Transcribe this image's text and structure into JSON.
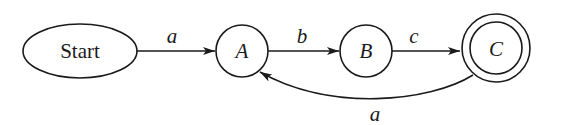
{
  "diagram": {
    "type": "finite-state-automaton",
    "nodes": [
      {
        "id": "start",
        "label": "Start",
        "shape": "ellipse",
        "accepting": false
      },
      {
        "id": "A",
        "label": "A",
        "shape": "circle",
        "accepting": false
      },
      {
        "id": "B",
        "label": "B",
        "shape": "circle",
        "accepting": false
      },
      {
        "id": "C",
        "label": "C",
        "shape": "double-circle",
        "accepting": true
      }
    ],
    "edges": [
      {
        "from": "start",
        "to": "A",
        "label": "a"
      },
      {
        "from": "A",
        "to": "B",
        "label": "b"
      },
      {
        "from": "B",
        "to": "C",
        "label": "c"
      },
      {
        "from": "C",
        "to": "A",
        "label": "a"
      }
    ],
    "colors": {
      "stroke": "#1a1a1a",
      "background": "#ffffff"
    }
  }
}
